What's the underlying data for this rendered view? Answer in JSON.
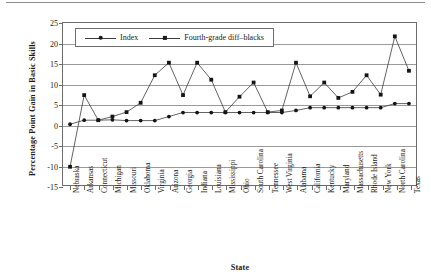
{
  "chart_data": {
    "type": "line",
    "title": "",
    "xlabel": "State",
    "ylabel": "Percentage Point Gain in Basic Skills",
    "ylim": [
      -15,
      25
    ],
    "ytick_values": [
      25,
      20,
      15,
      10,
      5,
      0,
      -5,
      -10,
      -15
    ],
    "ytick_labels": [
      "25",
      "20",
      "15",
      "10",
      "5",
      "0",
      "-5",
      "-10",
      "-15"
    ],
    "grid": true,
    "legend_position": "top-left-inside",
    "categories": [
      "Nebraska",
      "Arkansas",
      "Connecticut",
      "Michigan",
      "Missouri",
      "Oklahoma",
      "Virginia",
      "Arizona",
      "Georgia",
      "Indiana",
      "Louisiana",
      "Mississippi",
      "Ohio",
      "South Carolina",
      "Tennessee",
      "West Virginia",
      "Alabama",
      "California",
      "Kentucky",
      "Maryland",
      "Massachusetts",
      "Rhode Island",
      "New York",
      "North Carolina",
      "Texas"
    ],
    "series": [
      {
        "name": "Index",
        "marker": "diamond",
        "values": [
          0,
          1,
          1,
          1.1,
          0.9,
          0.9,
          0.9,
          1.9,
          2.9,
          2.9,
          2.9,
          2.9,
          2.9,
          2.9,
          2.9,
          2.9,
          3.4,
          4.1,
          4.1,
          4.1,
          4.1,
          4.1,
          4.1,
          5.1,
          5.1
        ]
      },
      {
        "name": "Fourth-grade diff–blacks",
        "marker": "square",
        "values": [
          -10.5,
          7.2,
          1,
          1.9,
          3,
          5.3,
          12.1,
          15.2,
          7.2,
          15.2,
          11,
          3,
          6.8,
          10.3,
          3,
          3.4,
          15.2,
          6.9,
          10.3,
          6.5,
          8,
          12.1,
          7.3,
          21.7,
          13.2
        ]
      }
    ]
  }
}
